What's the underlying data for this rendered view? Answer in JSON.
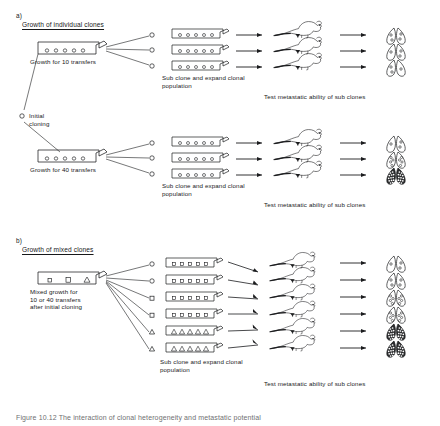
{
  "figure": {
    "caption": "Figure  10.12   The interaction of clonal  heterogeneity  and  metastatic potential",
    "sections": [
      {
        "id": "a",
        "marker": "a)",
        "heading": "Growth of individual clones",
        "panels": [
          {
            "source_label": "Growth for 10 transfers",
            "source_flask": {
              "marker_shape": "circle",
              "marker_count": 5
            },
            "subclone_note": "Sub clone and expand clonal\npopulation",
            "subclones": [
              {
                "marker_shape": "circle",
                "marker_count": 5,
                "lung_nodules": 4,
                "lung_density": "sparse"
              },
              {
                "marker_shape": "circle",
                "marker_count": 5,
                "lung_nodules": 3,
                "lung_density": "sparse"
              },
              {
                "marker_shape": "circle",
                "marker_count": 5,
                "lung_nodules": 3,
                "lung_density": "sparse"
              }
            ],
            "assay_label": "Test metastatic ability of sub clones"
          },
          {
            "source_label": "Growth for 40 transfers",
            "source_flask": {
              "marker_shape": "circle",
              "marker_count": 5
            },
            "subclone_note": "Sub clone and expand clonal\npopulation",
            "subclones": [
              {
                "marker_shape": "circle",
                "marker_count": 5,
                "lung_nodules": 3,
                "lung_density": "sparse"
              },
              {
                "marker_shape": "circle",
                "marker_count": 5,
                "lung_nodules": 7,
                "lung_density": "medium"
              },
              {
                "marker_shape": "circle",
                "marker_count": 5,
                "lung_nodules": 40,
                "lung_density": "dense"
              }
            ],
            "assay_label": "Test metastatic ability of sub clones"
          }
        ]
      },
      {
        "id": "b",
        "marker": "b)",
        "heading": "Growth of mixed clones",
        "panels": [
          {
            "source_label": "Mixed growth for\n10 or 40 transfers\nafter initial cloning",
            "source_flask": {
              "marker_shape": "mixed",
              "marker_count": 3
            },
            "subclone_note": "Sub clone and expand clonal\npopulation",
            "subclones": [
              {
                "marker_shape": "square",
                "marker_count": 5,
                "lung_nodules": 3,
                "lung_density": "sparse"
              },
              {
                "marker_shape": "square",
                "marker_count": 5,
                "lung_nodules": 4,
                "lung_density": "sparse"
              },
              {
                "marker_shape": "square",
                "marker_count": 5,
                "lung_nodules": 8,
                "lung_density": "medium"
              },
              {
                "marker_shape": "square",
                "marker_count": 5,
                "lung_nodules": 8,
                "lung_density": "medium"
              },
              {
                "marker_shape": "triangle",
                "marker_count": 5,
                "lung_nodules": 40,
                "lung_density": "dense"
              },
              {
                "marker_shape": "triangle",
                "marker_count": 5,
                "lung_nodules": 40,
                "lung_density": "dense"
              }
            ],
            "assay_label": "Test metastatic ability of sub clones"
          }
        ]
      }
    ],
    "initial_cloning_label": "Initial\ncloning",
    "colors": {
      "ink": "#1b1c1e",
      "caption": "#6f6f72",
      "background": "#ffffff"
    }
  }
}
